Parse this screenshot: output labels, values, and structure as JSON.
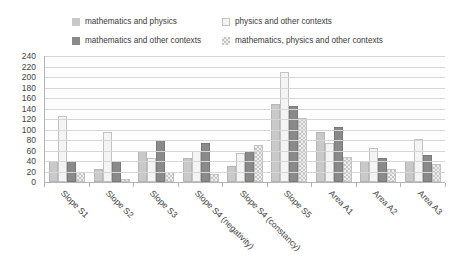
{
  "chart_data": {
    "type": "bar",
    "title": "",
    "xlabel": "",
    "ylabel": "",
    "ylim": [
      0,
      240
    ],
    "ytick_step": 20,
    "yticks": [
      240,
      220,
      200,
      180,
      160,
      140,
      120,
      100,
      80,
      60,
      40,
      20,
      0
    ],
    "grid": true,
    "legend_position": "top",
    "categories": [
      "Slope S1",
      "Slope S2",
      "Slope S3",
      "Slope S4 (negativity)",
      "Slope S4 (constancy)",
      "Slope S5",
      "Area A1",
      "Area A2",
      "Area A3"
    ],
    "series": [
      {
        "name": "mathematics and physics",
        "swatch_class": "s-mp",
        "color": "#c9c9c9",
        "values": [
          40,
          25,
          60,
          45,
          30,
          148,
          95,
          40,
          40
        ]
      },
      {
        "name": "physics and other contexts",
        "swatch_class": "s-poc",
        "color": "#f4f4f4",
        "values": [
          125,
          95,
          45,
          60,
          55,
          210,
          75,
          65,
          82
        ]
      },
      {
        "name": "mathematics and other contexts",
        "swatch_class": "s-moc",
        "color": "#8a8a8a",
        "values": [
          40,
          40,
          80,
          75,
          60,
          145,
          105,
          45,
          52
        ]
      },
      {
        "name": "mathematics, physics and other contexts",
        "swatch_class": "s-mpoc",
        "color": "#d9d9d9",
        "values": [
          20,
          5,
          20,
          15,
          70,
          122,
          48,
          25,
          35
        ]
      }
    ]
  }
}
